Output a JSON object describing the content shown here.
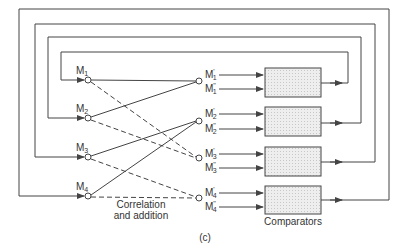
{
  "diagram": {
    "figure_label": "(c)",
    "correlation_label_line1": "Correlation",
    "correlation_label_line2": "and addition",
    "comparators_label": "Comparators",
    "colors": {
      "line": "#444444",
      "box_fill": "#e6e6e6",
      "background": "#ffffff"
    },
    "inputs": [
      {
        "label": "M",
        "sub": "1"
      },
      {
        "label": "M",
        "sub": "2"
      },
      {
        "label": "M",
        "sub": "3"
      },
      {
        "label": "M",
        "sub": "4"
      }
    ],
    "outputs": [
      {
        "label": "M",
        "sup": "'",
        "sub": "1"
      },
      {
        "label": "M",
        "sup": "\"",
        "sub": "1"
      },
      {
        "label": "M",
        "sup": "'",
        "sub": "2"
      },
      {
        "label": "M",
        "sup": "\"",
        "sub": "2"
      },
      {
        "label": "M",
        "sup": "'",
        "sub": "3"
      },
      {
        "label": "M",
        "sup": "\"",
        "sub": "3"
      },
      {
        "label": "M",
        "sup": "'",
        "sub": "4"
      },
      {
        "label": "M",
        "sup": "\"",
        "sub": "4"
      }
    ]
  }
}
